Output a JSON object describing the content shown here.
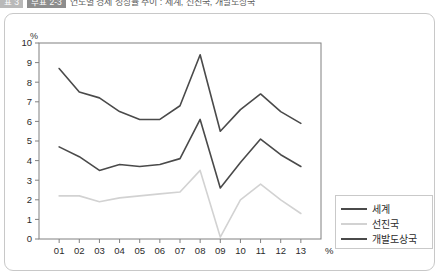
{
  "title_strip": {
    "badge_left": "표 3",
    "badge_right": "부표 2-3",
    "title": "연도별 경제 성장률 추이 : 세계, 선진국, 개발도상국"
  },
  "figure": {
    "unit_label": "%",
    "x_axis_unit": "%"
  },
  "legend": {
    "items": [
      {
        "label": "세계",
        "color": "#4a4a4a"
      },
      {
        "label": "선진국",
        "color": "#d2d2d2"
      },
      {
        "label": "개발도상국",
        "color": "#4a4a4a"
      }
    ]
  },
  "chart_data": {
    "type": "line",
    "title": "",
    "xlabel": "%",
    "ylabel": "%",
    "xlim": [
      0,
      14
    ],
    "ylim": [
      0,
      10
    ],
    "grid": false,
    "legend_position": "bottom-right",
    "x": [
      "01",
      "02",
      "03",
      "04",
      "05",
      "06",
      "07",
      "08",
      "09",
      "10",
      "11",
      "12",
      "13"
    ],
    "y_ticks": [
      0,
      1,
      2,
      3,
      4,
      5,
      6,
      7,
      8,
      9,
      10
    ],
    "series": [
      {
        "name": "개발도상국",
        "color": "#4a4a4a",
        "width": 1.6,
        "values": [
          8.7,
          7.5,
          7.2,
          6.5,
          6.1,
          6.1,
          6.8,
          9.4,
          5.5,
          6.6,
          7.4,
          6.5,
          5.9
        ]
      },
      {
        "name": "세계",
        "color": "#4a4a4a",
        "width": 1.6,
        "values": [
          4.7,
          4.2,
          3.5,
          3.8,
          3.7,
          3.8,
          4.1,
          6.1,
          2.6,
          3.9,
          5.1,
          4.3,
          3.7
        ]
      },
      {
        "name": "선진국",
        "color": "#d2d2d2",
        "width": 1.6,
        "values": [
          2.2,
          2.2,
          1.9,
          2.1,
          2.2,
          2.3,
          2.4,
          3.5,
          0.1,
          2.0,
          2.8,
          2.0,
          1.3
        ]
      }
    ]
  }
}
